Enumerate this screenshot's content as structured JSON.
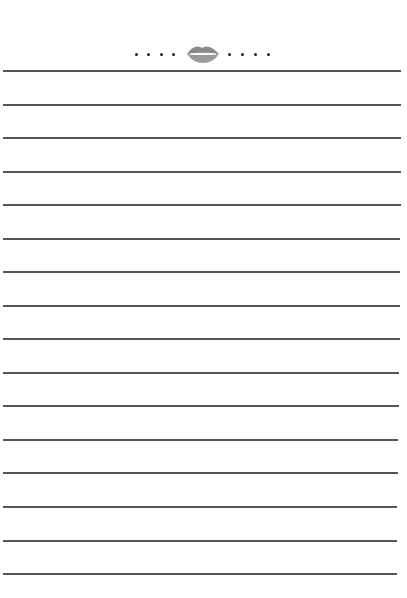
{
  "page": {
    "type": "lined-notepaper",
    "background": "#ffffff",
    "line_color": "#555555",
    "header": {
      "icon": "lips-kiss-icon",
      "icon_color": "#8a8a8a",
      "dots_left": 4,
      "dots_right": 4,
      "dot_color": "#222222"
    },
    "lines": [
      {
        "y": 70,
        "right": 401
      },
      {
        "y": 104,
        "right": 401
      },
      {
        "y": 137,
        "right": 401
      },
      {
        "y": 171,
        "right": 401
      },
      {
        "y": 204,
        "right": 401
      },
      {
        "y": 238,
        "right": 400
      },
      {
        "y": 271,
        "right": 400
      },
      {
        "y": 305,
        "right": 400
      },
      {
        "y": 338,
        "right": 400
      },
      {
        "y": 372,
        "right": 399
      },
      {
        "y": 405,
        "right": 399
      },
      {
        "y": 439,
        "right": 398
      },
      {
        "y": 472,
        "right": 398
      },
      {
        "y": 506,
        "right": 397
      },
      {
        "y": 540,
        "right": 397
      },
      {
        "y": 573,
        "right": 397
      }
    ]
  }
}
